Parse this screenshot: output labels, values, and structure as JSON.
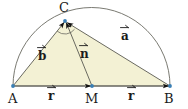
{
  "figure": {
    "type": "geometry-diagram",
    "background_color": "#ffffff",
    "triangle_fill": "#f3f1d4",
    "stroke_color": "#5a5a52",
    "point_color": "#3a7fb5",
    "arrow_color": "#111111",
    "width": 188,
    "height": 109
  },
  "points": [
    {
      "name": "A",
      "label": "A",
      "x": 13,
      "y": 86,
      "label_x": 8,
      "label_y": 92
    },
    {
      "name": "M",
      "label": "M",
      "x": 92,
      "y": 86,
      "label_x": 86,
      "label_y": 92
    },
    {
      "name": "B",
      "label": "B",
      "x": 170,
      "y": 86,
      "label_x": 165,
      "label_y": 92
    },
    {
      "name": "C",
      "label": "C",
      "x": 65,
      "y": 21,
      "label_x": 59,
      "label_y": 1
    }
  ],
  "vectors": [
    {
      "name": "b",
      "label": "b",
      "from": "A",
      "to": "C",
      "label_x": 38,
      "label_y": 50
    },
    {
      "name": "n",
      "label": "n",
      "from": "M",
      "to": "C",
      "label_x": 80,
      "label_y": 48
    },
    {
      "name": "a",
      "label": "a",
      "from": "B",
      "to": "C",
      "label_x": 121,
      "label_y": 30
    },
    {
      "name": "r1",
      "label": "r",
      "from": "A",
      "to": "M",
      "label_x": 48,
      "label_y": 90
    },
    {
      "name": "r2",
      "label": "r",
      "from": "M",
      "to": "B",
      "label_x": 128,
      "label_y": 90
    }
  ],
  "semicircle": {
    "center_x": 91.5,
    "center_y": 86,
    "radius": 78.5
  },
  "right_angle": {
    "at": "C",
    "marker": "arc"
  }
}
